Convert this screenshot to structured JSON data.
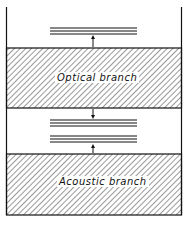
{
  "diagram": {
    "type": "energy-band schematic",
    "bands": [
      {
        "id": "optical",
        "label": "Optical branch"
      },
      {
        "id": "acoustic",
        "label": "Acoustic branch"
      }
    ],
    "levels": [
      {
        "group": "above-optical",
        "lines": 3
      },
      {
        "group": "gap-upper",
        "lines": 3
      },
      {
        "group": "gap-lower",
        "lines": 3
      }
    ],
    "colors": {
      "ink": "#111111",
      "background": "#ffffff"
    }
  }
}
